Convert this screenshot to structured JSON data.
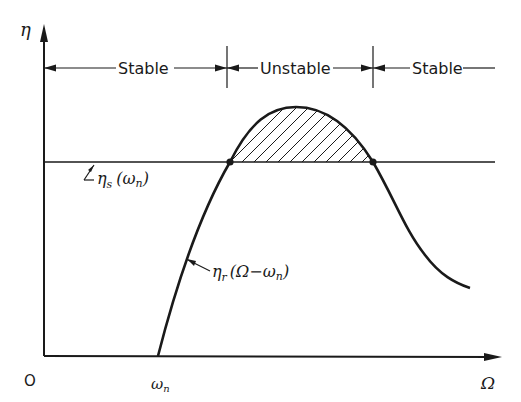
{
  "figure": {
    "axes": {
      "y_label": "η",
      "x_label": "Ω",
      "origin_label": "O",
      "x_tick_label": "ωn",
      "x_tick_main": "ω",
      "x_tick_sub": "n"
    },
    "regions": [
      {
        "label": "Stable"
      },
      {
        "label": "Unstable"
      },
      {
        "label": "Stable"
      }
    ],
    "curves": {
      "horizontal_line": {
        "main": "η",
        "sub": "s",
        "arg": "(ω",
        "arg_sub": "n",
        "close": ")"
      },
      "resonance_curve": {
        "main": "η",
        "sub": "r",
        "arg": "(Ω−ω",
        "arg_sub": "n",
        "close": ")"
      }
    },
    "shaded_region": "Unstable region between curve and horizontal line (hatched)",
    "colors": {
      "ink": "#1a1a1a",
      "background": "#ffffff"
    }
  }
}
